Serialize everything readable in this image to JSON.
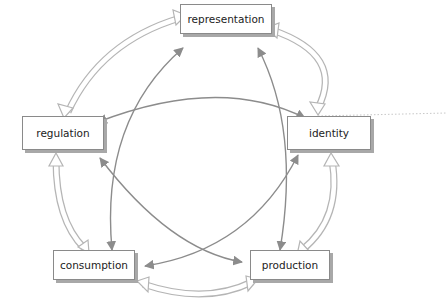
{
  "diagram": {
    "nodes": [
      {
        "id": "representation",
        "label": "representation"
      },
      {
        "id": "identity",
        "label": "identity"
      },
      {
        "id": "production",
        "label": "production"
      },
      {
        "id": "consumption",
        "label": "consumption"
      },
      {
        "id": "regulation",
        "label": "regulation"
      }
    ],
    "outer_links": [
      {
        "from": "representation",
        "to": "identity",
        "style": "hollow-double-arrow"
      },
      {
        "from": "identity",
        "to": "production",
        "style": "hollow-double-arrow"
      },
      {
        "from": "production",
        "to": "consumption",
        "style": "hollow-double-arrow"
      },
      {
        "from": "consumption",
        "to": "regulation",
        "style": "hollow-double-arrow"
      },
      {
        "from": "regulation",
        "to": "representation",
        "style": "hollow-double-arrow"
      }
    ],
    "inner_links": [
      {
        "from": "representation",
        "to": "consumption",
        "style": "solid-double-arrow"
      },
      {
        "from": "representation",
        "to": "production",
        "style": "solid-double-arrow"
      },
      {
        "from": "regulation",
        "to": "identity",
        "style": "solid-double-arrow"
      },
      {
        "from": "regulation",
        "to": "production",
        "style": "solid-double-arrow"
      },
      {
        "from": "identity",
        "to": "consumption",
        "style": "solid-double-arrow"
      }
    ],
    "colors": {
      "box_border": "#8a8a8a",
      "box_shadow": "#a8a8a8",
      "inner_arrow": "#8c8c8c",
      "outer_arrow": "#b5b5b5",
      "text": "#222222"
    }
  }
}
